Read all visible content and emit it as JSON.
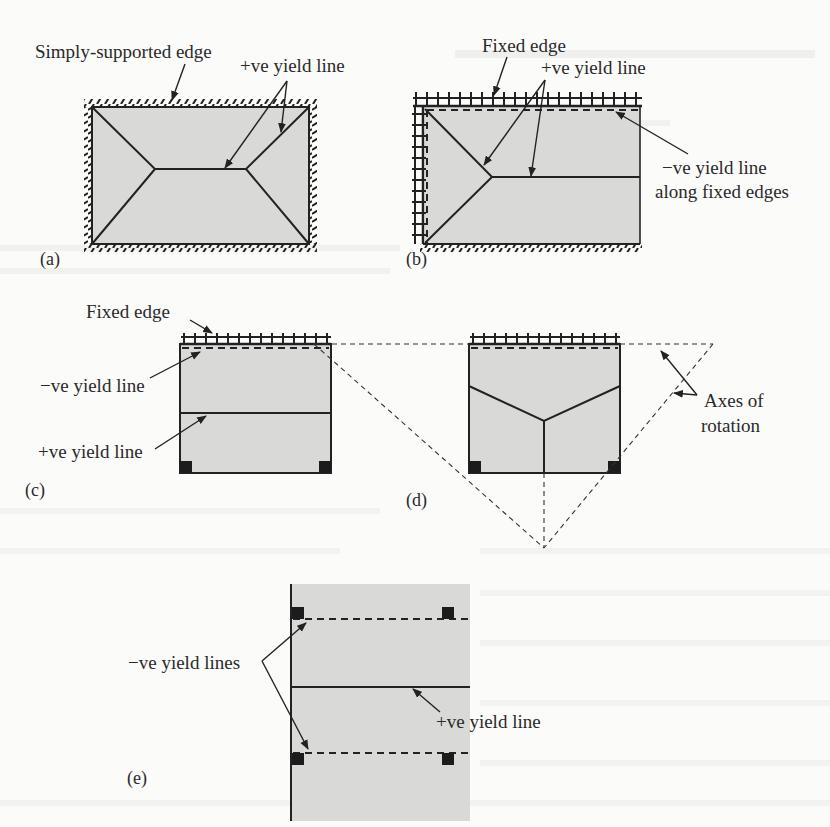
{
  "figure": {
    "panels": [
      {
        "id": "a",
        "caption": "(a)",
        "labels": {
          "support": "Simply-supported edge",
          "positive_yield_line": "+ve yield line"
        },
        "supports": "all four edges simply supported"
      },
      {
        "id": "b",
        "caption": "(b)",
        "labels": {
          "support": "Fixed edge",
          "positive_yield_line": "+ve yield line",
          "negative_yield_line_1": "−ve yield line",
          "negative_yield_line_2": "along fixed edges"
        },
        "supports": "top and left edges fixed, right edge free, bottom edge simply supported"
      },
      {
        "id": "c",
        "caption": "(c)",
        "labels": {
          "support": "Fixed edge",
          "negative_yield_line": "−ve yield line",
          "positive_yield_line": "+ve yield line"
        },
        "supports": "top edge fixed, bottom corner columns"
      },
      {
        "id": "d",
        "caption": "(d)",
        "labels": {
          "axes_1": "Axes of",
          "axes_2": "rotation"
        },
        "supports": "top edge fixed, bottom corner columns"
      },
      {
        "id": "e",
        "caption": "(e)",
        "labels": {
          "negative_yield_lines": "−ve yield lines",
          "positive_yield_line": "+ve yield line"
        },
        "supports": "four corner columns, left edge simply supported"
      }
    ],
    "colors": {
      "plate_fill": "#d9d9d8",
      "line": "#222222",
      "background": "#fbfbfa"
    }
  }
}
